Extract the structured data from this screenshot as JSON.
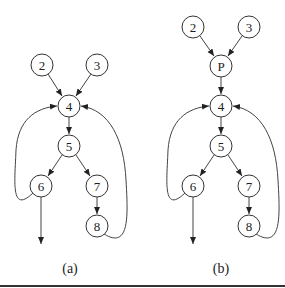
{
  "figure": {
    "panels": [
      {
        "label": "(a)",
        "nodes": [
          {
            "id": "2",
            "x": 42,
            "y": 65
          },
          {
            "id": "3",
            "x": 97,
            "y": 65
          },
          {
            "id": "4",
            "x": 69,
            "y": 106
          },
          {
            "id": "5",
            "x": 69,
            "y": 146
          },
          {
            "id": "6",
            "x": 41,
            "y": 186
          },
          {
            "id": "7",
            "x": 97,
            "y": 186
          },
          {
            "id": "8",
            "x": 97,
            "y": 226
          }
        ],
        "edges": [
          [
            "2",
            "4"
          ],
          [
            "3",
            "4"
          ],
          [
            "4",
            "5"
          ],
          [
            "5",
            "6"
          ],
          [
            "5",
            "7"
          ],
          [
            "7",
            "8"
          ],
          [
            "6",
            "4"
          ],
          [
            "8",
            "4"
          ],
          [
            "6",
            "exit"
          ]
        ]
      },
      {
        "label": "(b)",
        "nodes": [
          {
            "id": "2",
            "x": 193,
            "y": 27
          },
          {
            "id": "3",
            "x": 249,
            "y": 27
          },
          {
            "id": "P",
            "x": 221,
            "y": 66
          },
          {
            "id": "4",
            "x": 221,
            "y": 106
          },
          {
            "id": "5",
            "x": 221,
            "y": 146
          },
          {
            "id": "6",
            "x": 193,
            "y": 186
          },
          {
            "id": "7",
            "x": 249,
            "y": 186
          },
          {
            "id": "8",
            "x": 249,
            "y": 226
          }
        ],
        "edges": [
          [
            "2",
            "P"
          ],
          [
            "3",
            "P"
          ],
          [
            "P",
            "4"
          ],
          [
            "4",
            "5"
          ],
          [
            "5",
            "6"
          ],
          [
            "5",
            "7"
          ],
          [
            "7",
            "8"
          ],
          [
            "6",
            "4"
          ],
          [
            "8",
            "4"
          ],
          [
            "6",
            "exit"
          ]
        ]
      }
    ]
  }
}
